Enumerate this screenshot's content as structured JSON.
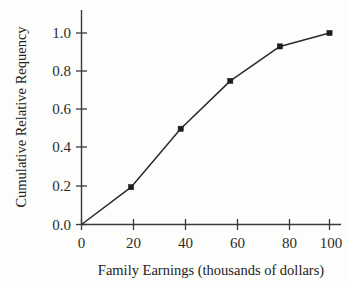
{
  "chart_data": {
    "type": "line",
    "title": "",
    "xlabel": "Family Earnings (thousands of dollars)",
    "ylabel": "Cumulative Relative Requency",
    "x": [
      0,
      20,
      40,
      60,
      80,
      100
    ],
    "values": [
      0.0,
      0.195,
      0.5,
      0.75,
      0.93,
      1.0
    ],
    "series": [
      {
        "name": "Cumulative relative frequency",
        "x": [
          0,
          20,
          40,
          60,
          80,
          100
        ],
        "values": [
          0.0,
          0.195,
          0.5,
          0.75,
          0.93,
          1.0
        ]
      }
    ],
    "xlim": [
      0,
      100
    ],
    "ylim": [
      0.0,
      1.0
    ],
    "xticks": [
      0,
      20,
      40,
      60,
      80,
      100
    ],
    "yticks": [
      0.0,
      0.2,
      0.4,
      0.6,
      0.8,
      1.0
    ],
    "xtick_labels": [
      "0",
      "20",
      "40",
      "60",
      "80",
      "100"
    ],
    "ytick_labels": [
      "0.0",
      "0.2",
      "0.4",
      "0.6",
      "0.8",
      "1.0"
    ],
    "grid": false,
    "legend": null,
    "marker": "square",
    "line_color": "#2a2a2a",
    "marker_color": "#1d1d1d",
    "background_color": "#fdfdfb"
  },
  "axes": {
    "x_label": "Family Earnings (thousands of dollars)",
    "y_label": "Cumulative Relative Requency",
    "x_ticks": [
      "0",
      "20",
      "40",
      "60",
      "80",
      "100"
    ],
    "y_ticks": [
      "0.0",
      "0.2",
      "0.4",
      "0.6",
      "0.8",
      "1.0"
    ]
  }
}
